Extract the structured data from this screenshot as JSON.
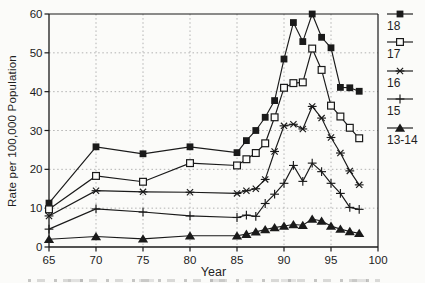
{
  "chart_data": {
    "type": "line",
    "title": "",
    "xlabel": "Year",
    "ylabel": "Rate per 100,000 Population",
    "xlim": [
      65,
      100
    ],
    "ylim": [
      0,
      60
    ],
    "x_ticks": [
      65,
      70,
      75,
      80,
      85,
      90,
      95,
      100
    ],
    "y_ticks": [
      0,
      10,
      20,
      30,
      40,
      50,
      60
    ],
    "grid": "dotted",
    "legend_position": "right-outside",
    "x": [
      65,
      70,
      75,
      80,
      85,
      86,
      87,
      88,
      89,
      90,
      91,
      92,
      93,
      94,
      95,
      96,
      97,
      98
    ],
    "series": [
      {
        "name": "18",
        "marker": "filled-square",
        "values": [
          11.3,
          25.8,
          24.0,
          25.8,
          24.3,
          27.4,
          30.0,
          33.4,
          37.7,
          48.4,
          57.8,
          52.9,
          60.0,
          54.0,
          51.3,
          41.1,
          41.0,
          40.1
        ]
      },
      {
        "name": "17",
        "marker": "open-square",
        "values": [
          9.7,
          18.3,
          16.8,
          21.6,
          21.0,
          22.6,
          24.2,
          26.7,
          33.4,
          41.0,
          42.2,
          42.4,
          51.1,
          45.6,
          36.4,
          33.6,
          30.7,
          28.0
        ]
      },
      {
        "name": "16",
        "marker": "asterisk",
        "values": [
          8.0,
          14.5,
          14.2,
          14.1,
          13.8,
          14.5,
          15.0,
          17.4,
          24.6,
          31.2,
          31.6,
          30.4,
          36.2,
          33.2,
          28.2,
          24.2,
          19.6,
          16.0
        ]
      },
      {
        "name": "15",
        "marker": "plus",
        "values": [
          4.6,
          9.8,
          9.0,
          8.0,
          7.6,
          8.2,
          7.9,
          11.2,
          13.6,
          16.4,
          21.0,
          16.9,
          21.6,
          19.4,
          16.4,
          13.8,
          10.2,
          9.7
        ]
      },
      {
        "name": "13-14",
        "marker": "filled-triangle",
        "values": [
          2.0,
          2.7,
          2.1,
          2.9,
          2.9,
          3.3,
          3.9,
          4.5,
          5.0,
          5.4,
          5.8,
          5.6,
          7.2,
          6.7,
          5.4,
          4.6,
          4.0,
          3.5
        ]
      }
    ],
    "colors": {
      "ink": "#1a1a1a",
      "grid": "#b2b2b2",
      "paper": "#fbfbf9"
    }
  }
}
